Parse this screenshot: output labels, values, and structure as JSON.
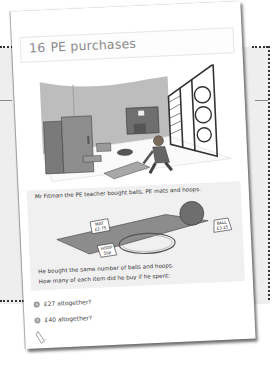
{
  "page": {
    "number": "16",
    "title": "PE purchases"
  },
  "problem": {
    "intro": "Mr Fitman the PE teacher bought balls, PE mats and hoops.",
    "price_tags": [
      {
        "item": "MAT",
        "price": "£2.75"
      },
      {
        "item": "BALL",
        "price": "£3.25"
      },
      {
        "item": "HOOP",
        "price": "50p"
      }
    ],
    "statement": "He bought the same number of balls and hoops.",
    "question": "How many of each item did he buy if he spent:"
  },
  "questions": [
    {
      "badge": "a",
      "text": "£27 altogether?"
    },
    {
      "badge": "b",
      "text": "£40 altogether?"
    }
  ],
  "icons": {
    "footer": "pencil-icon"
  },
  "colors": {
    "panel_bg": "#f0f0f0",
    "title_text": "#8a8a8a",
    "ball": "#6e6e6e",
    "mat": "#8c8c8c"
  }
}
